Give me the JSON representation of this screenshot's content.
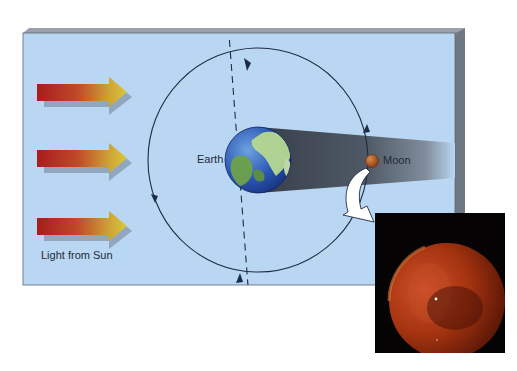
{
  "diagram": {
    "labels": {
      "earth": "Earth",
      "moon": "Moon",
      "sun_light": "Light from Sun"
    },
    "elements": {
      "sun_arrows_count": 3,
      "orbit_direction": "counterclockwise",
      "earth_axis": "dashed, tilted",
      "shadow": "Earth's umbral shadow cone extending right, Moon inside it",
      "inset_photo": "Red eclipsed Moon against black sky",
      "callout_arrow": "white curved arrow from Moon to photo"
    },
    "colors": {
      "panel_bg": "#b9d7f2",
      "panel_edge": "#7c8593",
      "arrow_start": "#a81c1c",
      "arrow_end": "#d8c232",
      "arrow_shadow": "#8b9fb4",
      "shadow_cone": "#3f4752",
      "orbit_line": "#1d2c44",
      "moon": "#b0541f",
      "eclipse_moon": "#b23a14",
      "photo_bg": "#050304"
    }
  }
}
